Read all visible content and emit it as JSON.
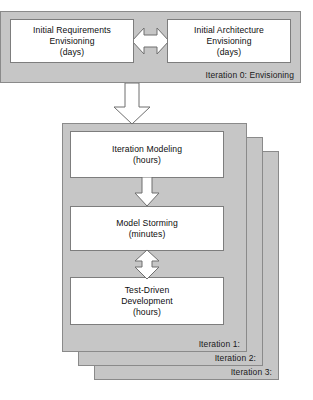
{
  "diagram": {
    "colors": {
      "panel_fill": "#c6c6c6",
      "panel_border": "#8a8a8a",
      "box_fill": "#ffffff",
      "box_border": "#7d7d7d",
      "text": "#0d0d0d",
      "arrow_fill": "#ffffff",
      "arrow_border": "#6e6e6e",
      "background": "#ffffff"
    },
    "envisioning": {
      "label": "Iteration 0: Envisioning",
      "boxes": [
        {
          "line1": "Initial Requirements",
          "line2": "Envisioning",
          "line3": "(days)"
        },
        {
          "line1": "Initial Architecture",
          "line2": "Envisioning",
          "line3": "(days)"
        }
      ],
      "connector": {
        "name": "bidirectional-horizontal-arrow",
        "direction": "both"
      }
    },
    "transition_arrow": {
      "name": "down-arrow-to-iterations",
      "direction": "down"
    },
    "iterations": {
      "stack_labels": [
        "Iteration 1:",
        "Iteration 2:",
        "Iteration 3:"
      ],
      "boxes": [
        {
          "line1": "Iteration Modeling",
          "line2": "(hours)",
          "line3": ""
        },
        {
          "line1": "Model Storming",
          "line2": "(minutes)",
          "line3": ""
        },
        {
          "line1": "Test-Driven",
          "line2": "Development",
          "line3": "(hours)"
        }
      ],
      "connectors": [
        {
          "name": "down-arrow-modeling-to-storming",
          "direction": "down"
        },
        {
          "name": "bidirectional-arrow-storming-to-tdd",
          "direction": "both"
        }
      ]
    }
  }
}
